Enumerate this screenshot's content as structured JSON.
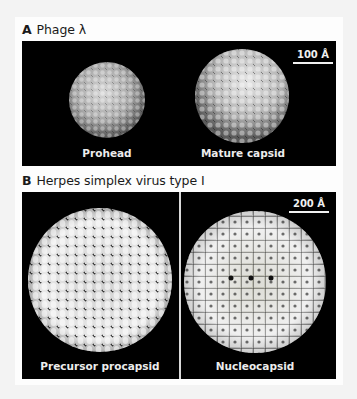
{
  "figure": {
    "panel_a": {
      "letter": "A",
      "title": "Phage λ",
      "scale_bar": "100 Å",
      "images": [
        {
          "label": "Prohead"
        },
        {
          "label": "Mature capsid"
        }
      ]
    },
    "panel_b": {
      "letter": "B",
      "title": "Herpes simplex virus type I",
      "scale_bar": "200 Å",
      "images": [
        {
          "label": "Precursor procapsid"
        },
        {
          "label": "Nucleocapsid"
        }
      ]
    }
  },
  "colors": {
    "page_bg": "#f3f3f3",
    "card_bg": "#fdfdfd",
    "panel_bg": "#000000",
    "label_text": "#ececec"
  }
}
